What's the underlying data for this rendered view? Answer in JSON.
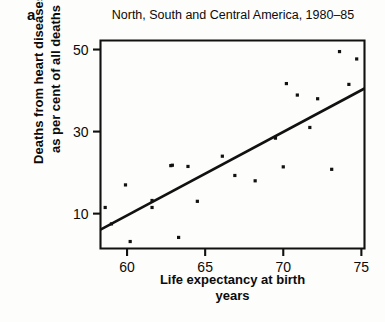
{
  "panel": {
    "label": "a"
  },
  "chart_data": {
    "type": "scatter",
    "title": "North, South and Central America, 1980–85",
    "xlabel": "Life expectancy at birth",
    "xlabel_line2": "years",
    "ylabel": "Deaths from heart diseases",
    "ylabel_line2": "as per cent of all deaths",
    "xlim": [
      58.3,
      75.2
    ],
    "ylim": [
      1.5,
      52.2
    ],
    "xticks": [
      60,
      65,
      70,
      75
    ],
    "xtick_labels": [
      "60",
      "65",
      "70",
      "75"
    ],
    "yticks": [
      10,
      30,
      50
    ],
    "ytick_labels": [
      "10",
      "30",
      "50"
    ],
    "grid": false,
    "legend": null,
    "marker": "square-dot",
    "marker_color": "#111111",
    "frame_color": "#111111",
    "points": [
      {
        "x": 58.6,
        "y": 11.5
      },
      {
        "x": 59.0,
        "y": 7.5
      },
      {
        "x": 59.9,
        "y": 17.0
      },
      {
        "x": 60.2,
        "y": 3.2
      },
      {
        "x": 61.6,
        "y": 13.2
      },
      {
        "x": 61.6,
        "y": 11.5
      },
      {
        "x": 62.8,
        "y": 21.7
      },
      {
        "x": 62.9,
        "y": 21.8
      },
      {
        "x": 63.3,
        "y": 4.2
      },
      {
        "x": 63.9,
        "y": 21.5
      },
      {
        "x": 64.5,
        "y": 13.0
      },
      {
        "x": 66.1,
        "y": 24.0
      },
      {
        "x": 66.9,
        "y": 19.3
      },
      {
        "x": 68.2,
        "y": 18.0
      },
      {
        "x": 69.5,
        "y": 28.4
      },
      {
        "x": 70.0,
        "y": 21.4
      },
      {
        "x": 70.2,
        "y": 41.7
      },
      {
        "x": 70.9,
        "y": 38.9
      },
      {
        "x": 71.7,
        "y": 31.0
      },
      {
        "x": 72.2,
        "y": 38.0
      },
      {
        "x": 73.1,
        "y": 20.8
      },
      {
        "x": 73.6,
        "y": 49.5
      },
      {
        "x": 74.2,
        "y": 41.5
      },
      {
        "x": 74.7,
        "y": 47.7
      }
    ],
    "fit_line": {
      "x0": 58.3,
      "y0": 6.1,
      "x1": 75.2,
      "y1": 40.5
    }
  }
}
